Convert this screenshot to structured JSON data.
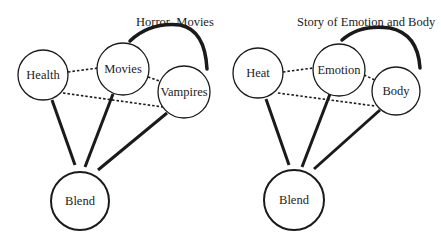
{
  "diagrams": [
    {
      "title": "Horror  Movies",
      "nodes": {
        "a": {
          "label": "Health"
        },
        "b": {
          "label": "Movies"
        },
        "c": {
          "label": "Vampires"
        },
        "blend": {
          "label": "Blend"
        }
      }
    },
    {
      "title": "Story of Emotion and Body",
      "nodes": {
        "a": {
          "label": "Heat"
        },
        "b": {
          "label": "Emotion"
        },
        "c": {
          "label": "Body"
        },
        "blend": {
          "label": "Blend"
        }
      }
    }
  ],
  "colors": {
    "stroke": "#1a1a1a",
    "background": "#ffffff"
  }
}
